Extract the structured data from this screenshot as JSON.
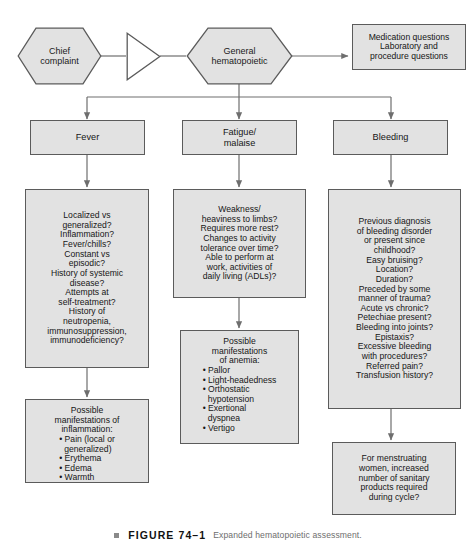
{
  "figure": {
    "marker_icon": "square-marker-icon",
    "number": "FIGURE 74–1",
    "caption": "Expanded hematopoietic assessment."
  },
  "nodes": {
    "chief_complaint": "Chief\ncomplaint",
    "connector_triangle": "triangle-connector-icon",
    "general_hematopoietic": "General\nhematopoietic",
    "medication_questions": "Medication questions\nLaboratory and\nprocedure questions",
    "branch_fever": "Fever",
    "branch_fatigue": "Fatigue/\nmalaise",
    "branch_bleeding": "Bleeding",
    "fever_questions": "Localized vs\ngeneralized?\nInflammation?\nFever/chills?\nConstant vs\nepisodic?\nHistory of systemic\ndisease?\nAttempts at\nself-treatment?\nHistory of\nneutropenia,\nimmunosuppression,\nimmunodeficiency?",
    "inflammation_heading": "Possible\nmanifestations of\ninflammation:",
    "inflammation_items": [
      "Pain (local or\n  generalized)",
      "Erythema",
      "Edema",
      "Warmth"
    ],
    "fatigue_questions": "Weakness/\nheaviness to limbs?\nRequires more rest?\nChanges to activity\ntolerance over time?\nAble to perform at\nwork, activities of\ndaily living (ADLs)?",
    "anemia_heading": "Possible\nmanifestations\nof anemia:",
    "anemia_items": [
      "Pallor",
      "Light-headedness",
      "Orthostatic\n  hypotension",
      "Exertional\n  dyspnea",
      "Vertigo"
    ],
    "bleeding_questions": "Previous diagnosis\nof bleeding disorder\nor present since\nchildhood?\nEasy bruising?\nLocation?\nDuration?\nPreceded by some\nmanner of trauma?\nAcute vs chronic?\nPetechiae present?\nBleeding into joints?\nEpistaxis?\nExcessive bleeding\nwith procedures?\nReferred pain?\nTransfusion history?",
    "menstruating_note": "For menstruating\nwomen, increased\nnumber of sanitary\nproducts required\nduring cycle?"
  },
  "colors": {
    "node_fill": "#e2e2e2",
    "node_border": "#5b5b5b",
    "arrow": "#6e6e6e",
    "text": "#161616",
    "caption_text": "#6e6e6e",
    "background": "#ffffff"
  }
}
